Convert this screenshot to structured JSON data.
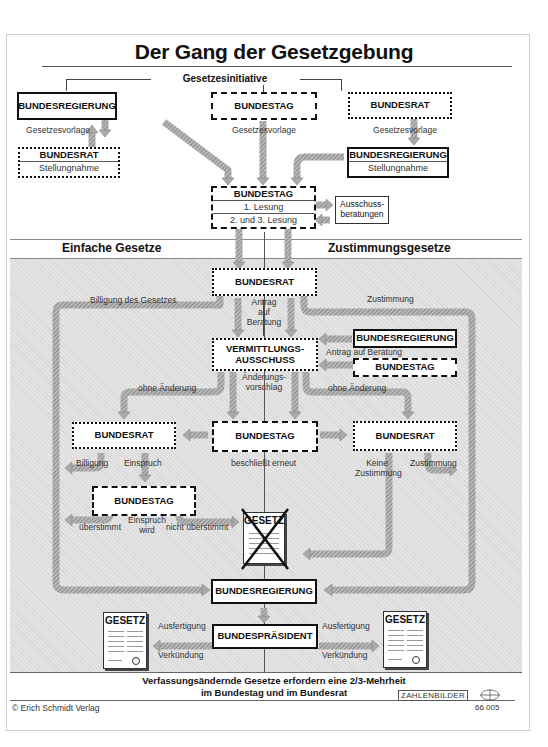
{
  "title": "Der Gang der Gesetzgebung",
  "initiative": {
    "label": "Gesetzesinitiative",
    "initiators": [
      {
        "name": "BUNDESREGIERUNG",
        "border": "solid",
        "output_label": "Gesetzesvorlage",
        "review": {
          "name": "BUNDESRAT",
          "sub": "Stellungnahme",
          "border": "dotted"
        }
      },
      {
        "name": "BUNDESTAG",
        "border": "dashed",
        "output_label": "Gesetzesvorlage"
      },
      {
        "name": "BUNDESRAT",
        "border": "dotted",
        "output_label": "Gesetzesvorlage",
        "review": {
          "name": "BUNDESREGIERUNG",
          "sub": "Stellungnahme",
          "border": "solid"
        }
      }
    ]
  },
  "bundestag_main": {
    "name": "BUNDESTAG",
    "readings": [
      "1. Lesung",
      "2. und 3. Lesung"
    ],
    "committee": "Ausschuss-\nberatungen"
  },
  "sections": {
    "left": "Einfache Gesetze",
    "right": "Zustimmungsgesetze"
  },
  "flow": {
    "bundesrat_1": "BUNDESRAT",
    "billigung_des_gesetzes": "Billigung des Gesetzes",
    "antrag_auf_beratung_vertical": "Antrag\nauf\nBeratung",
    "zustimmung_top": "Zustimmung",
    "vermittlung": "VERMITTLUNGS-\nAUSSCHUSS",
    "right_requesters": [
      "BUNDESREGIERUNG",
      "BUNDESTAG"
    ],
    "antrag_auf_beratung_horizontal": "Antrag auf Beratung",
    "aenderungsvorschlag": "Änderungs-\nvorschlag",
    "ohne_aenderung_left": "ohne Änderung",
    "ohne_aenderung_right": "ohne Änderung",
    "bundesrat_left": "BUNDESRAT",
    "bundestag_mid": "BUNDESTAG",
    "bundesrat_right": "BUNDESRAT",
    "billigung": "Billigung",
    "einspruch": "Einspruch",
    "beschliesst_erneut": "beschließt erneut",
    "keine_zustimmung": "Keine\nZustimmung",
    "zustimmung_right": "Zustimmung",
    "bundestag_einspruch": "BUNDESTAG",
    "ueberstimmt": "überstimmt",
    "einspruch_wird": "Einspruch\nwird",
    "nicht_ueberstimmt": "nicht überstimmt",
    "failed_law": "GESETZ",
    "bundesregierung_final": "BUNDESREGIERUNG",
    "bundespraesident": "BUNDESPRÄSIDENT",
    "ausfertigung": "Ausfertigung",
    "verkuendung": "Verkündung",
    "gesetz_doc": "GESETZ"
  },
  "footer": {
    "note_line1": "Verfassungsändernde Gesetze erfordern eine 2/3-Mehrheit",
    "note_line2": "im Bundestag und im Bundesrat",
    "publisher": "© Erich Schmidt Verlag",
    "brand": "ZAHLENBILDER",
    "number": "66 005"
  },
  "colors": {
    "arrow_fill": "#a9a9a9",
    "shade_bg": "#e4e4e4",
    "text": "#111111"
  }
}
